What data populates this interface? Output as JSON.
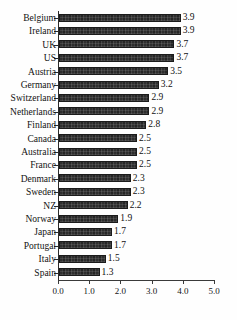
{
  "chart_data": {
    "type": "bar",
    "orientation": "horizontal",
    "title": "",
    "subtitle": "",
    "xlabel": "",
    "ylabel": "",
    "xlim": [
      0.0,
      5.0
    ],
    "xticks": [
      "0.0",
      "1.0",
      "2.0",
      "3.0",
      "4.0",
      "5.0"
    ],
    "xtick_values": [
      0.0,
      1.0,
      2.0,
      3.0,
      4.0,
      5.0
    ],
    "grid": false,
    "legend": null,
    "data_labels_shown": true,
    "bar_color": "#2e2e2e",
    "axis_color": "#2b2b2b",
    "background_color": "#fefefe",
    "categories": [
      "Belgium",
      "Ireland",
      "UK",
      "US",
      "Austria",
      "Germany",
      "Switzerland",
      "Netherlands",
      "Finland",
      "Canada",
      "Australia",
      "France",
      "Denmark",
      "Sweden",
      "NZ",
      "Norway",
      "Japan",
      "Portugal",
      "Italy",
      "Spain"
    ],
    "values": [
      3.9,
      3.9,
      3.7,
      3.7,
      3.5,
      3.2,
      2.9,
      2.9,
      2.8,
      2.5,
      2.5,
      2.5,
      2.3,
      2.3,
      2.2,
      1.9,
      1.7,
      1.7,
      1.5,
      1.3
    ],
    "value_labels": [
      "3.9",
      "3.9",
      "3.7",
      "3.7",
      "3.5",
      "3.2",
      "2.9",
      "2.9",
      "2.8",
      "2.5",
      "2.5",
      "2.5",
      "2.3",
      "2.3",
      "2.2",
      "1.9",
      "1.7",
      "1.7",
      "1.5",
      "1.3"
    ]
  }
}
